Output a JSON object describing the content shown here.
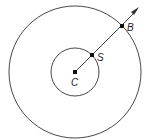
{
  "diagram": {
    "center": {
      "label": "C",
      "x": 75,
      "y": 72
    },
    "inner_circle": {
      "r": 24
    },
    "outer_circle": {
      "r": 66
    },
    "points": [
      {
        "label": "C",
        "x": 75,
        "y": 72
      },
      {
        "label": "S",
        "x": 92,
        "y": 55
      },
      {
        "label": "B",
        "x": 122,
        "y": 26
      }
    ],
    "ray": {
      "from": "C",
      "through": [
        "S",
        "B"
      ],
      "arrow_tip": {
        "x": 139,
        "y": 8
      }
    },
    "colors": {
      "stroke": "#333333",
      "background": "#ffffff"
    }
  },
  "labels": {
    "c": "C",
    "s": "S",
    "b": "B"
  }
}
